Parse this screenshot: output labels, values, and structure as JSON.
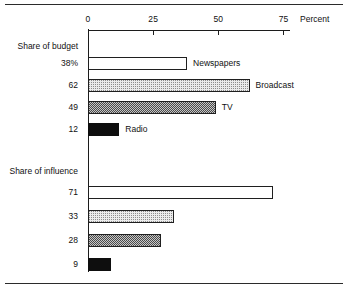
{
  "chart_data": {
    "type": "bar",
    "orientation": "horizontal",
    "title": "",
    "xlabel": "Percent",
    "ylabel": "",
    "xlim": [
      0,
      80
    ],
    "xticks": [
      0,
      25,
      50,
      75
    ],
    "xtick_labels": [
      "0",
      "25",
      "50",
      "75"
    ],
    "grid": false,
    "legend": "none",
    "groups": [
      {
        "name": "Share of budget",
        "bars": [
          {
            "value": 38,
            "value_label": "38%",
            "category": "Newspapers",
            "fill": "white"
          },
          {
            "value": 62,
            "value_label": "62",
            "category": "Broadcast",
            "fill": "light"
          },
          {
            "value": 49,
            "value_label": "49",
            "category": "TV",
            "fill": "medium"
          },
          {
            "value": 12,
            "value_label": "12",
            "category": "Radio",
            "fill": "solid"
          }
        ]
      },
      {
        "name": "Share of influence",
        "bars": [
          {
            "value": 71,
            "value_label": "71",
            "category": "",
            "fill": "white"
          },
          {
            "value": 33,
            "value_label": "33",
            "category": "",
            "fill": "light"
          },
          {
            "value": 28,
            "value_label": "28",
            "category": "",
            "fill": "medium"
          },
          {
            "value": 9,
            "value_label": "9",
            "category": "",
            "fill": "solid"
          }
        ]
      }
    ],
    "categories": [
      "Newspapers",
      "Broadcast",
      "TV",
      "Radio"
    ],
    "series": [
      {
        "name": "Share of budget",
        "values": [
          38,
          62,
          49,
          12
        ]
      },
      {
        "name": "Share of influence",
        "values": [
          71,
          33,
          28,
          9
        ]
      }
    ],
    "colors": {
      "axis": "#1c1c1c",
      "text": "#111111",
      "rule": "#2b2b2b",
      "fill_white": "#ffffff",
      "fill_light": "#ebebeb",
      "fill_medium": "#c6c6c6",
      "fill_solid": "#0e0e0e"
    }
  },
  "axis": {
    "unit_label": "Percent",
    "ticks": [
      "0",
      "25",
      "50",
      "75"
    ]
  },
  "groups": {
    "budget_heading": "Share of budget",
    "influence_heading": "Share of influence"
  },
  "rows": {
    "b0_value": "38%",
    "b0_label": "Newspapers",
    "b1_value": "62",
    "b1_label": "Broadcast",
    "b2_value": "49",
    "b2_label": "TV",
    "b3_value": "12",
    "b3_label": "Radio",
    "i0_value": "71",
    "i0_label": "",
    "i1_value": "33",
    "i1_label": "",
    "i2_value": "28",
    "i2_label": "",
    "i3_value": "9",
    "i3_label": ""
  }
}
